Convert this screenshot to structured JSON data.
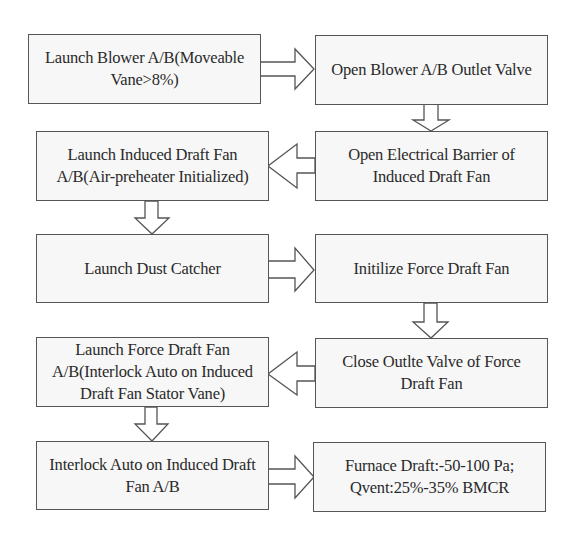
{
  "flowchart": {
    "steps": [
      {
        "id": "s1",
        "label": "Launch Blower A/B(Moveable Vane>8%)"
      },
      {
        "id": "s2",
        "label": "Open Blower A/B Outlet Valve"
      },
      {
        "id": "s3",
        "label": "Open  Electrical Barrier of Induced Draft Fan"
      },
      {
        "id": "s4",
        "label": "Launch Induced Draft Fan A/B(Air-preheater Initialized)"
      },
      {
        "id": "s5",
        "label": "Launch Dust Catcher"
      },
      {
        "id": "s6",
        "label": "Initilize Force Draft Fan"
      },
      {
        "id": "s7",
        "label": "Close Outlte Valve of Force Draft Fan"
      },
      {
        "id": "s8",
        "label": "Launch Force Draft Fan A/B(Interlock Auto on Induced Draft Fan Stator Vane)"
      },
      {
        "id": "s9",
        "label": "Interlock Auto on Induced Draft Fan A/B"
      },
      {
        "id": "s10",
        "label": "Furnace Draft:-50-100 Pa; Qvent:25%-35% BMCR"
      }
    ],
    "connections": [
      {
        "from": "s1",
        "to": "s2",
        "direction": "right"
      },
      {
        "from": "s2",
        "to": "s3",
        "direction": "down"
      },
      {
        "from": "s3",
        "to": "s4",
        "direction": "left"
      },
      {
        "from": "s4",
        "to": "s5",
        "direction": "down"
      },
      {
        "from": "s5",
        "to": "s6",
        "direction": "right"
      },
      {
        "from": "s6",
        "to": "s7",
        "direction": "down"
      },
      {
        "from": "s7",
        "to": "s8",
        "direction": "left"
      },
      {
        "from": "s8",
        "to": "s9",
        "direction": "down"
      },
      {
        "from": "s9",
        "to": "s10",
        "direction": "right"
      }
    ],
    "colors": {
      "box_border": "#555555",
      "box_fill": "#f7f7f7",
      "arrow_fill": "#ffffff",
      "text": "#2a2a2a"
    }
  }
}
